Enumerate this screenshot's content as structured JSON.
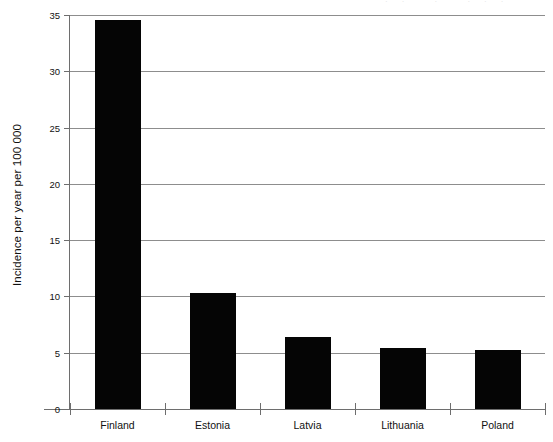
{
  "figure": {
    "background_color": "#ffffff",
    "bar_color": "#050505",
    "grid_color": "#8d8d8d",
    "axis_color": "#6e6e6e",
    "top_edge_artifact": "··   ·   ···"
  },
  "chart_data": {
    "type": "bar",
    "title": "",
    "subtitle": "",
    "xlabel": "",
    "ylabel": "Incidence per year per 100 000",
    "categories": [
      "Finland",
      "Estonia",
      "Latvia",
      "Lithuania",
      "Poland"
    ],
    "values": [
      34.6,
      10.3,
      6.4,
      5.4,
      5.2
    ],
    "series": [
      {
        "name": "Incidence",
        "values": [
          34.6,
          10.3,
          6.4,
          5.4,
          5.2
        ]
      }
    ],
    "ylim": [
      0,
      35
    ],
    "yticks": [
      0,
      5,
      10,
      15,
      20,
      25,
      30,
      35
    ],
    "ytick_labels": [
      "0",
      "5",
      "10",
      "15",
      "20",
      "25",
      "30",
      "35"
    ],
    "grid": "horizontal",
    "legend": "none",
    "legend_position": "none",
    "annotations": []
  }
}
